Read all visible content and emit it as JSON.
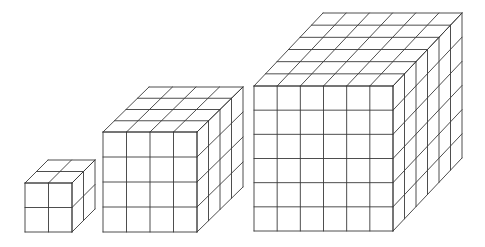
{
  "diagram": {
    "type": "isometric-unit-cubes",
    "background": "#ffffff",
    "line_color": "#3a3a3a",
    "cubes": [
      {
        "name": "cube-2x2x2",
        "n": 2,
        "front_x": 25,
        "front_y": 183,
        "width": 47,
        "height": 49,
        "depth_dx": 23,
        "depth_dy": -23
      },
      {
        "name": "cube-4x4x4",
        "n": 4,
        "front_x": 103,
        "front_y": 132,
        "width": 94,
        "height": 100,
        "depth_dx": 46,
        "depth_dy": -45
      },
      {
        "name": "cube-6x6x6",
        "n": 6,
        "front_x": 254,
        "front_y": 86,
        "width": 139,
        "height": 145,
        "depth_dx": 69,
        "depth_dy": -73
      }
    ]
  }
}
